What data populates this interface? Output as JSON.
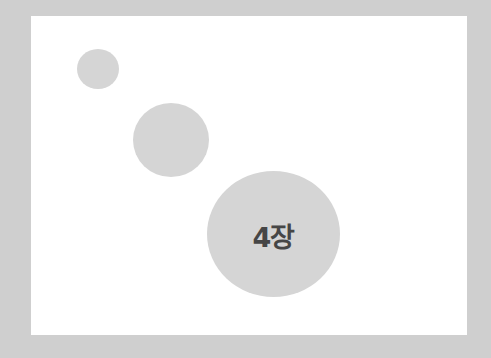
{
  "diagram": {
    "background_color": "#cfcfcf",
    "panel_color": "#ffffff",
    "circle_color": "#d5d5d5",
    "text_color": "#464646",
    "circles": [
      {
        "size": "small",
        "label": ""
      },
      {
        "size": "medium",
        "label": ""
      },
      {
        "size": "large",
        "label": "4장"
      }
    ]
  }
}
